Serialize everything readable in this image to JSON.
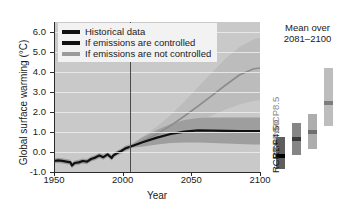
{
  "chart_data": {
    "type": "line",
    "title": "",
    "xlabel": "Year",
    "ylabel": "Global surface warming (°C)",
    "xlim": [
      1950,
      2100
    ],
    "ylim": [
      -1.0,
      6.5
    ],
    "yticks": [
      "6.0",
      "5.0",
      "4.0",
      "3.0",
      "2.0",
      "1.0",
      "0.0",
      "-1.0"
    ],
    "ytick_values": [
      6.0,
      5.0,
      4.0,
      3.0,
      2.0,
      1.0,
      0.0,
      -1.0
    ],
    "xticks": [
      "1950",
      "2000",
      "2050",
      "2100"
    ],
    "xtick_values": [
      1950,
      2000,
      2050,
      2100
    ],
    "grid": true,
    "legend_position": "top-left",
    "historical_end_year": 2005,
    "series": [
      {
        "name": "Historical data",
        "color": "#101010",
        "x": [
          1950,
          1953,
          1956,
          1959,
          1962,
          1963,
          1965,
          1968,
          1971,
          1974,
          1977,
          1980,
          1983,
          1986,
          1989,
          1992,
          1993,
          1996,
          1999,
          2002,
          2005
        ],
        "values": [
          -0.45,
          -0.42,
          -0.44,
          -0.48,
          -0.52,
          -0.68,
          -0.55,
          -0.52,
          -0.45,
          -0.48,
          -0.35,
          -0.28,
          -0.18,
          -0.26,
          -0.12,
          -0.3,
          -0.18,
          -0.05,
          0.05,
          0.18,
          0.25
        ]
      },
      {
        "name": "If emissions are controlled",
        "color": "#101010",
        "scenario": "RCP2.6",
        "x": [
          2005,
          2015,
          2025,
          2035,
          2045,
          2055,
          2065,
          2075,
          2085,
          2095,
          2100
        ],
        "values": [
          0.25,
          0.5,
          0.72,
          0.9,
          1.02,
          1.08,
          1.07,
          1.06,
          1.05,
          1.05,
          1.05
        ],
        "band_low": [
          0.2,
          0.28,
          0.38,
          0.45,
          0.48,
          0.48,
          0.45,
          0.42,
          0.4,
          0.38,
          0.38
        ],
        "band_high": [
          0.32,
          0.75,
          1.1,
          1.4,
          1.6,
          1.7,
          1.72,
          1.72,
          1.72,
          1.72,
          1.72
        ]
      },
      {
        "name": "If emissions are not controlled",
        "color": "#8c8c8c",
        "scenario": "RCP8.5",
        "x": [
          2005,
          2015,
          2025,
          2035,
          2045,
          2055,
          2065,
          2075,
          2085,
          2095,
          2100
        ],
        "values": [
          0.25,
          0.55,
          0.9,
          1.32,
          1.8,
          2.3,
          2.82,
          3.35,
          3.85,
          4.15,
          4.2
        ],
        "band_low": [
          0.2,
          0.35,
          0.58,
          0.85,
          1.15,
          1.48,
          1.82,
          2.12,
          2.38,
          2.55,
          2.6
        ],
        "band_high": [
          0.32,
          0.8,
          1.28,
          1.85,
          2.52,
          3.25,
          3.98,
          4.68,
          5.25,
          5.62,
          5.7
        ]
      }
    ],
    "legend": [
      {
        "label": "Historical data",
        "color": "#101010"
      },
      {
        "label": "If emissions are controlled",
        "color": "#101010"
      },
      {
        "label": "If emissions are not controlled",
        "color": "#9a9a9a"
      }
    ],
    "inset_panel": {
      "title_line1": "Mean over",
      "title_line2": "2081–2100",
      "ylim": [
        -1.0,
        6.5
      ],
      "bars": [
        {
          "label": "RCP2.6",
          "mean": 1.0,
          "low": 0.3,
          "high": 1.95,
          "color": "#5e5e5e",
          "mean_color": "#000000"
        },
        {
          "label": "RCP4.5",
          "mean": 1.85,
          "low": 1.05,
          "high": 2.7,
          "color": "#858585",
          "mean_color": "#3a3a3a"
        },
        {
          "label": "RCP6.0",
          "mean": 2.25,
          "low": 1.35,
          "high": 3.15,
          "color": "#adadad",
          "mean_color": "#6e6e6e"
        },
        {
          "label": "RCP8.5",
          "mean": 3.75,
          "low": 2.55,
          "high": 5.55,
          "color": "#bdbdbd",
          "mean_color": "#7d7d7d"
        }
      ]
    },
    "colors": {
      "plot_background": "#c9c9c9",
      "gridline": "#ededed",
      "band_controlled": "#9e9e9e",
      "band_uncontrolled": "#bcbcbc",
      "axis": "#2b2b2b",
      "divider": "#4a4a4a"
    }
  }
}
